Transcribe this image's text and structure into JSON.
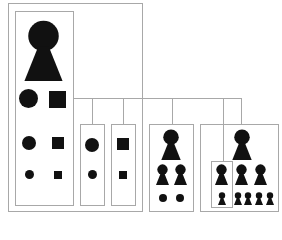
{
  "diagram": {
    "colors": {
      "line": "#a8a8a8",
      "shape": "#111111",
      "background": "#ffffff"
    },
    "groups": [
      {
        "id": "root",
        "contents": [
          "keyhole-large",
          "circle-large",
          "square-large",
          "circle-medium",
          "square-medium",
          "circle-small",
          "square-small"
        ]
      },
      {
        "id": "circles",
        "contents": [
          "circle-medium",
          "circle-small"
        ]
      },
      {
        "id": "squares",
        "contents": [
          "square-medium",
          "square-small"
        ]
      },
      {
        "id": "keyhole-family-1",
        "contents": [
          "keyhole-medium",
          "keyhole-small",
          "keyhole-small",
          "dot",
          "dot"
        ]
      },
      {
        "id": "keyhole-family-2",
        "contents": [
          "keyhole-medium",
          "keyhole-small",
          "keyhole-small",
          "keyhole-small",
          "keyhole-tiny",
          "keyhole-tiny",
          "keyhole-tiny",
          "keyhole-tiny",
          "keyhole-tiny"
        ]
      }
    ]
  }
}
